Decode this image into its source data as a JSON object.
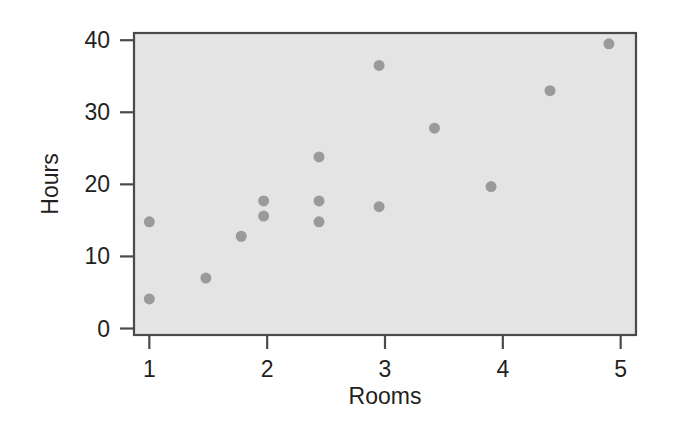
{
  "chart_data": {
    "type": "scatter",
    "title": "",
    "xlabel": "Rooms",
    "ylabel": "Hours",
    "xlim": [
      0.87,
      5.13
    ],
    "ylim": [
      -0.9,
      41.0
    ],
    "xticks": [
      1,
      2,
      3,
      4,
      5
    ],
    "xticklabels": [
      "1",
      "2",
      "3",
      "4",
      "5"
    ],
    "yticks": [
      0,
      10,
      20,
      30,
      40
    ],
    "yticklabels": [
      "0",
      "10",
      "20",
      "30",
      "40"
    ],
    "grid": false,
    "legend": null,
    "marker": "filled-circle",
    "marker_size_px": 11,
    "points": [
      {
        "x": 1.0,
        "y": 14.8
      },
      {
        "x": 1.0,
        "y": 4.1
      },
      {
        "x": 1.48,
        "y": 7.0
      },
      {
        "x": 1.78,
        "y": 12.8
      },
      {
        "x": 1.97,
        "y": 17.7
      },
      {
        "x": 1.97,
        "y": 15.6
      },
      {
        "x": 2.44,
        "y": 23.8
      },
      {
        "x": 2.44,
        "y": 17.7
      },
      {
        "x": 2.44,
        "y": 14.8
      },
      {
        "x": 2.95,
        "y": 36.5
      },
      {
        "x": 2.95,
        "y": 16.9
      },
      {
        "x": 3.42,
        "y": 27.8
      },
      {
        "x": 3.9,
        "y": 19.7
      },
      {
        "x": 4.4,
        "y": 33.0
      },
      {
        "x": 4.9,
        "y": 39.5
      }
    ],
    "series": [
      {
        "name": "Hours vs Rooms",
        "x": [
          1.0,
          1.0,
          1.48,
          1.78,
          1.97,
          1.97,
          2.44,
          2.44,
          2.44,
          2.95,
          2.95,
          3.42,
          3.9,
          4.4,
          4.9
        ],
        "values": [
          14.8,
          4.1,
          7.0,
          12.8,
          17.7,
          15.6,
          23.8,
          17.7,
          14.8,
          36.5,
          16.9,
          27.8,
          19.7,
          33.0,
          39.5
        ]
      }
    ],
    "n_points": 15,
    "colors": {
      "page_background": "#ffffff",
      "plot_background": "#e4e4e4",
      "marker": "#9a9a9a",
      "axis_line": "#4a4a4a",
      "text": "#231f20"
    }
  },
  "geometry": {
    "plot_left": 134,
    "plot_right": 636,
    "plot_top": 33,
    "plot_bottom": 335
  }
}
